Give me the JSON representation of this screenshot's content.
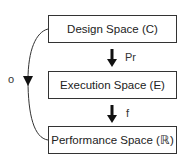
{
  "diagram": {
    "boxes": [
      {
        "label": "Design Space (C)"
      },
      {
        "label": "Execution Space (E)"
      },
      {
        "label": "Performance Space (ℝ)"
      }
    ],
    "arrows": [
      {
        "from": "Design Space (C)",
        "to": "Execution Space (E)",
        "label": "Pr"
      },
      {
        "from": "Execution Space (E)",
        "to": "Performance Space (ℝ)",
        "label": "f"
      },
      {
        "from": "Design Space (C)",
        "to": "Performance Space (ℝ)",
        "label": "o",
        "style": "curved"
      }
    ]
  }
}
